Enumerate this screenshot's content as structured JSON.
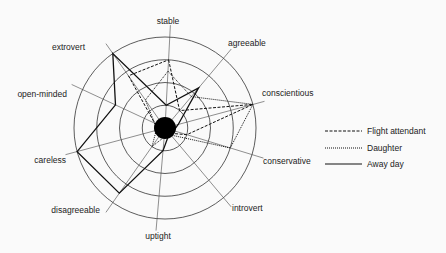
{
  "chart_data": {
    "type": "radar",
    "title": "",
    "scale": {
      "min": 0,
      "max": 4,
      "rings": 4
    },
    "axes": [
      "stable",
      "agreeable",
      "conscientious",
      "conservative",
      "introvert",
      "uptight",
      "disagreeable",
      "careless",
      "open-minded",
      "extrovert"
    ],
    "series": [
      {
        "name": "Flight attendant",
        "style": "dashed",
        "values": [
          3,
          1,
          4,
          1,
          0.3,
          0.3,
          0.3,
          0.3,
          0.5,
          2.8
        ]
      },
      {
        "name": "Daughter",
        "style": "dotted",
        "values": [
          2.5,
          1.8,
          4,
          3,
          0.4,
          0.4,
          1,
          0.4,
          0.5,
          1.5
        ]
      },
      {
        "name": "Away day",
        "style": "solid",
        "values": [
          1,
          2.3,
          0.6,
          0.4,
          0.3,
          1,
          3.5,
          4,
          2.4,
          4
        ]
      }
    ],
    "legend_position": "right"
  },
  "legend": {
    "items": [
      {
        "label": "Flight attendant"
      },
      {
        "label": "Daughter"
      },
      {
        "label": "Away day"
      }
    ]
  }
}
